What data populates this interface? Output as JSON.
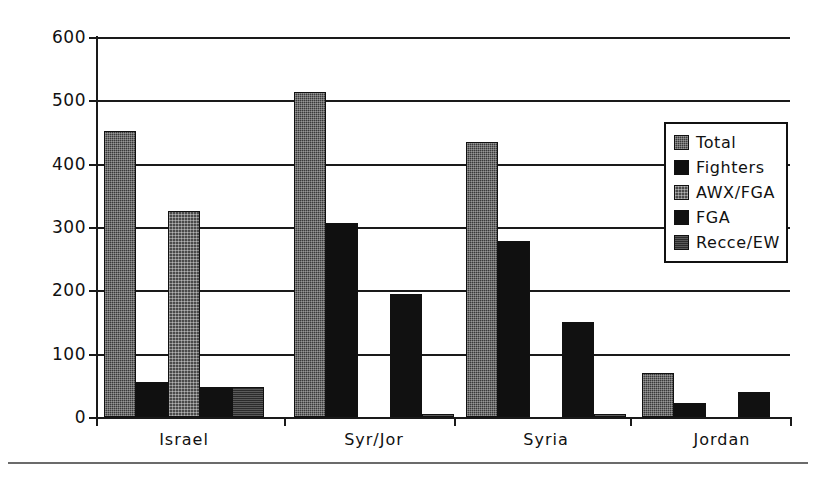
{
  "chart_data": {
    "type": "bar",
    "title": "",
    "xlabel": "",
    "ylabel": "",
    "ylim": [
      0,
      600
    ],
    "ytick_step": 100,
    "yticks": [
      "0",
      "100",
      "200",
      "300",
      "400",
      "500",
      "600"
    ],
    "grid": true,
    "legend_position": "right-inside",
    "categories": [
      "Israel",
      "Syr/Jor",
      "Syria",
      "Jordan"
    ],
    "series": [
      {
        "name": "Total",
        "fill": "fill-total",
        "values": [
          452,
          513,
          435,
          70
        ]
      },
      {
        "name": "Fighters",
        "fill": "fill-fighters",
        "values": [
          55,
          307,
          278,
          22
        ]
      },
      {
        "name": "AWX/FGA",
        "fill": "fill-awxfga",
        "values": [
          325,
          0,
          0,
          0
        ]
      },
      {
        "name": "FGA",
        "fill": "fill-fga",
        "values": [
          48,
          195,
          150,
          40
        ]
      },
      {
        "name": "Recce/EW",
        "fill": "fill-recceew",
        "values": [
          48,
          5,
          5,
          0
        ]
      }
    ]
  },
  "legend": {
    "items": [
      {
        "label": "Total",
        "fill": "fill-total"
      },
      {
        "label": "Fighters",
        "fill": "fill-fighters"
      },
      {
        "label": "AWX/FGA",
        "fill": "fill-awxfga"
      },
      {
        "label": "FGA",
        "fill": "fill-fga"
      },
      {
        "label": "Recce/EW",
        "fill": "fill-recceew"
      }
    ]
  }
}
